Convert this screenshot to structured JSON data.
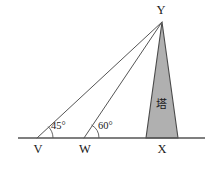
{
  "figure": {
    "colors": {
      "line": "#555555",
      "tower_fill": "#b0b0b0",
      "tower_stroke": "#4a4a4a",
      "text": "#1a1a1a",
      "background": "#ffffff"
    },
    "baseline": {
      "x1": 18,
      "y1": 138,
      "x2": 205,
      "y2": 138
    },
    "points": {
      "Y": {
        "label": "Y",
        "x": 162,
        "y": 22,
        "label_x": 161,
        "label_y": 14
      },
      "V": {
        "label": "V",
        "x": 37,
        "y": 138,
        "label_x": 38,
        "label_y": 153
      },
      "W": {
        "label": "W",
        "x": 84,
        "y": 138,
        "label_x": 85,
        "label_y": 153
      },
      "X": {
        "label": "X",
        "x": 162,
        "y": 138,
        "label_x": 162,
        "label_y": 153
      }
    },
    "angles": [
      {
        "name": "angle-at-V",
        "label": "45°",
        "vertex": "V",
        "value": 45,
        "label_x": 51,
        "label_y": 129,
        "arc_radius": 16
      },
      {
        "name": "angle-at-W",
        "label": "60°",
        "vertex": "W",
        "value": 60,
        "label_x": 98,
        "label_y": 129,
        "arc_radius": 15
      }
    ],
    "tower": {
      "label": "塔",
      "label_x": 161,
      "label_y": 108,
      "apex_x": 162,
      "apex_y": 22,
      "base_left_x": 146,
      "base_right_x": 178,
      "base_y": 138,
      "fill": "#b0b0b0"
    },
    "rays": [
      {
        "name": "ray-V-to-Y",
        "from": "V",
        "to": "Y"
      },
      {
        "name": "ray-W-to-Y",
        "from": "W",
        "to": "Y"
      }
    ]
  }
}
